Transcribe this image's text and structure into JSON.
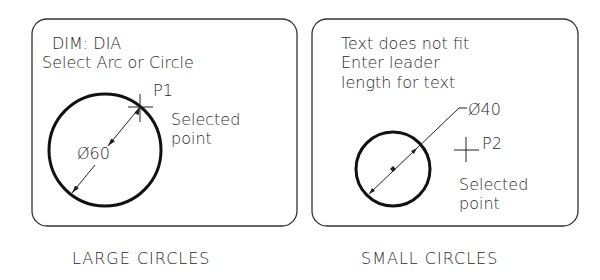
{
  "panels": [
    {
      "id": "large",
      "prompt_lines": [
        "DIM: DIA",
        "Select Arc or Circle"
      ],
      "point_label": "P1",
      "selected_text": [
        "Selected",
        "point"
      ],
      "dimension_text": "Ø60",
      "caption": "LARGE CIRCLES"
    },
    {
      "id": "small",
      "prompt_lines": [
        "Text does not fit",
        "Enter leader",
        "length for text"
      ],
      "point_label": "P2",
      "selected_text": [
        "Selected",
        "point"
      ],
      "dimension_text": "Ø40",
      "caption": "SMALL CIRCLES"
    }
  ]
}
